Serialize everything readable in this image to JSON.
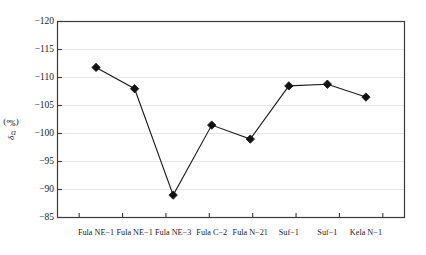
{
  "chart_data": {
    "type": "line",
    "title": "",
    "xlabel": "",
    "ylabel": "δD (‰)",
    "ylabel_symbol": "δ",
    "ylabel_subscript": "D",
    "ylabel_unit": "(‰)",
    "categories": [
      "Fula NE-1",
      "Fula NE-1",
      "Fula NE-3",
      "Fula C-2",
      "Fula N-21",
      "Suf-1",
      "Suf-1",
      "Kela N-1"
    ],
    "values": [
      -111.8,
      -108.0,
      -89.0,
      -101.5,
      -99.0,
      -108.5,
      -108.8,
      -106.5
    ],
    "series": [
      {
        "name": "δD",
        "values": [
          -111.8,
          -108.0,
          -89.0,
          -101.5,
          -99.0,
          -108.5,
          -108.8,
          -106.5
        ]
      }
    ],
    "yticks": [
      -120,
      -115,
      -110,
      -105,
      -100,
      -95,
      -90,
      -85
    ],
    "ytick_labels": [
      "-120",
      "-115",
      "-110",
      "-105",
      "-100",
      "-95",
      "-90",
      "-85"
    ],
    "ylim": [
      -120,
      -85
    ],
    "y_axis_inverted": true,
    "grid": true,
    "grid_axis": "y",
    "legend": false,
    "legend_position": "none",
    "marker": "diamond",
    "marker_color": "#111111",
    "line_color": "#1a1a1a",
    "frame_color": "#3a3a3a",
    "grid_color": "#e2e2e2",
    "background": "#ffffff"
  },
  "colors": {
    "marker": "#111111",
    "line": "#1a1a1a",
    "frame": "#3a3a3a",
    "grid": "#e6e6e6",
    "text": "#1a1a1a",
    "background": "#ffffff"
  }
}
